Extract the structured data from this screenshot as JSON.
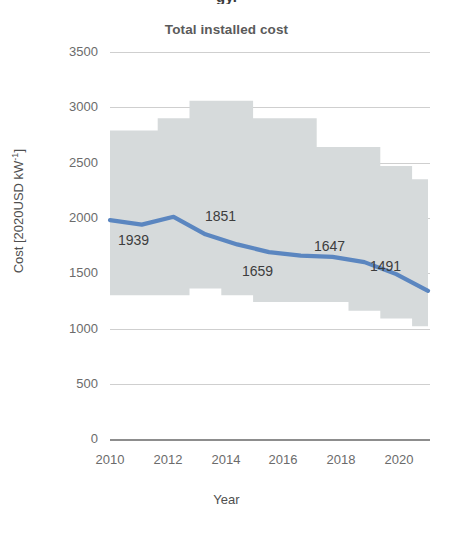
{
  "clipped_header": "gy.",
  "chart_data": {
    "type": "line",
    "title": "Total installed cost",
    "xlabel": "Year",
    "ylabel": "Cost [2020USD kW⁻¹]",
    "ylim": [
      0,
      3500
    ],
    "xlim": [
      2009.5,
      2020.5
    ],
    "grid": true,
    "legend": null,
    "ytick_labels": [
      "3500",
      "3000",
      "2500",
      "2000",
      "1500",
      "1000",
      "500",
      "0"
    ],
    "ytick_values": [
      3500,
      3000,
      2500,
      2000,
      1500,
      1000,
      500,
      0
    ],
    "xtick_labels": [
      "2010",
      "2012",
      "2014",
      "2016",
      "2018",
      "2020"
    ],
    "xtick_values": [
      2010,
      2012,
      2014,
      2016,
      2018,
      2020
    ],
    "x": [
      2010,
      2011,
      2012,
      2013,
      2014,
      2015,
      2016,
      2017,
      2018,
      2019,
      2020
    ],
    "series": [
      {
        "name": "Global weighted average total installed cost",
        "color": "#5b86c0",
        "values": [
          1980,
          1939,
          2010,
          1851,
          1760,
          1690,
          1659,
          1647,
          1600,
          1491,
          1340
        ]
      }
    ],
    "range_band": {
      "name": "5th-95th percentile range",
      "color": "#d6dadb",
      "upper": [
        2790,
        2790,
        2900,
        3060,
        3060,
        2900,
        2900,
        2640,
        2640,
        2470,
        2350
      ],
      "lower": [
        1300,
        1300,
        1300,
        1360,
        1300,
        1240,
        1240,
        1240,
        1160,
        1090,
        1020
      ]
    },
    "annotations": [
      {
        "label": "1939",
        "x": 2011,
        "y": 1939
      },
      {
        "label": "1851",
        "x": 2013,
        "y": 1851
      },
      {
        "label": "1659",
        "x": 2016,
        "y": 1659
      },
      {
        "label": "1647",
        "x": 2017,
        "y": 1647
      },
      {
        "label": "1491",
        "x": 2019,
        "y": 1491
      }
    ]
  }
}
